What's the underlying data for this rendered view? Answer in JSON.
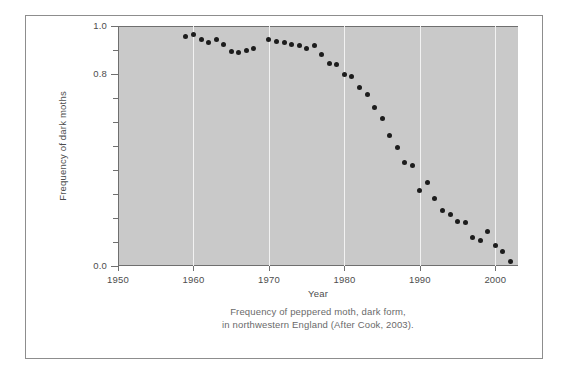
{
  "figure": {
    "caption_line1": "Frequency of peppered moth, dark form,",
    "caption_line2": "in northwestern England (After Cook, 2003).",
    "panel_background": "#c9c9c9",
    "gridline_color": "#f2f2f2",
    "marker_color": "#1c1c1c",
    "axis_color": "#6f6f6f"
  },
  "chart_data": {
    "type": "scatter",
    "title": "",
    "xlabel": "Year",
    "ylabel": "Frequency of dark moths",
    "xlim": [
      1950,
      2003
    ],
    "ylim": [
      0.0,
      1.0
    ],
    "grid": true,
    "gridlines_x": [
      1960,
      1970,
      1980,
      1990,
      2000
    ],
    "legend": null,
    "xticks": [
      1950,
      1960,
      1970,
      1980,
      1990,
      2000
    ],
    "xtick_labels": [
      "1950",
      "1960",
      "1970",
      "1980",
      "1990",
      "2000"
    ],
    "yticks": [
      0.0,
      0.1,
      0.2,
      0.3,
      0.4,
      0.5,
      0.6,
      0.7,
      0.8,
      0.9,
      1.0
    ],
    "ytick_labels_shown": {
      "1.0": "1.0",
      "0.8": "0.8",
      "0.0": "0.0"
    },
    "x": [
      1959,
      1960,
      1961,
      1962,
      1963,
      1964,
      1965,
      1966,
      1967,
      1968,
      1970,
      1971,
      1972,
      1973,
      1974,
      1975,
      1976,
      1977,
      1978,
      1979,
      1980,
      1981,
      1982,
      1983,
      1984,
      1985,
      1986,
      1987,
      1988,
      1989,
      1990,
      1991,
      1992,
      1993,
      1994,
      1995,
      1996,
      1997,
      1998,
      1999,
      2000,
      2001,
      2002
    ],
    "y": [
      0.955,
      0.965,
      0.945,
      0.93,
      0.945,
      0.925,
      0.895,
      0.89,
      0.9,
      0.905,
      0.945,
      0.935,
      0.93,
      0.925,
      0.92,
      0.905,
      0.92,
      0.88,
      0.845,
      0.84,
      0.8,
      0.79,
      0.745,
      0.715,
      0.66,
      0.615,
      0.545,
      0.495,
      0.43,
      0.42,
      0.315,
      0.35,
      0.28,
      0.23,
      0.215,
      0.185,
      0.18,
      0.12,
      0.105,
      0.145,
      0.085,
      0.06,
      0.02
    ]
  }
}
